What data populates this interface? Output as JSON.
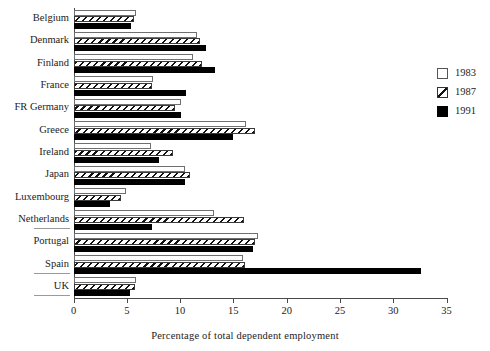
{
  "chart_data": {
    "type": "bar",
    "orientation": "horizontal",
    "title": "",
    "xlabel": "Percentage of  total dependent employment",
    "ylabel": "",
    "xlim": [
      0,
      35
    ],
    "xticks": [
      0,
      5,
      10,
      15,
      20,
      25,
      30,
      35
    ],
    "grid": false,
    "legend_position": "right",
    "categories": [
      "Belgium",
      "Denmark",
      "Finland",
      "France",
      "FR Germany",
      "Greece",
      "Ireland",
      "Japan",
      "Luxembourg",
      "Netherlands",
      "Portugal",
      "Spain",
      "UK"
    ],
    "series": [
      {
        "name": "1983",
        "style": "open",
        "color": "#ffffff",
        "values": [
          5.9,
          11.6,
          11.2,
          7.5,
          10.1,
          16.2,
          7.3,
          10.5,
          4.9,
          13.2,
          17.3,
          15.9,
          5.9
        ]
      },
      {
        "name": "1987",
        "style": "hatched",
        "color": "#111111",
        "values": [
          5.7,
          11.9,
          12.1,
          7.4,
          9.5,
          17.0,
          9.3,
          10.9,
          4.5,
          16.0,
          17.0,
          16.1,
          5.8
        ]
      },
      {
        "name": "1991",
        "style": "solid",
        "color": "#000000",
        "values": [
          5.4,
          12.4,
          13.3,
          10.6,
          10.1,
          15.0,
          8.0,
          10.5,
          3.4,
          7.4,
          16.8,
          32.6,
          5.3
        ]
      }
    ]
  },
  "legend": {
    "entries": [
      {
        "label": "1983",
        "swatch": "open-square-icon"
      },
      {
        "label": "1987",
        "swatch": "hatched-square-icon"
      },
      {
        "label": "1991",
        "swatch": "filled-square-icon"
      }
    ]
  },
  "axis": {
    "x_title": "Percentage of  total dependent employment",
    "tick_labels": [
      "0",
      "5",
      "10",
      "15",
      "20",
      "25",
      "30",
      "35"
    ]
  },
  "colors": {
    "series_1983": "#ffffff",
    "series_1987": "#111111",
    "series_1991": "#000000",
    "axis": "#4a4a4a",
    "text": "#222222",
    "background": "#ffffff"
  }
}
